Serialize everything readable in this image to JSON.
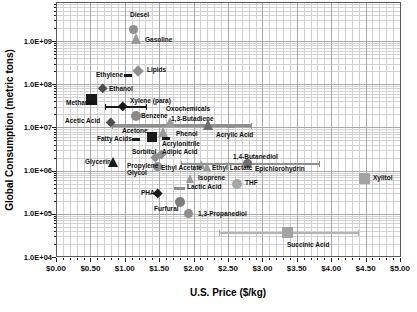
{
  "figure": {
    "background": "#ffffff",
    "frame_color": "#595959",
    "grid_minor_color": "#d2d2d2",
    "grid_major_color": "#a8a8a8",
    "tick_color": "#1a1a1a"
  },
  "chart_data": {
    "type": "scatter",
    "title": "",
    "xlabel": "U.S. Price ($/kg)",
    "ylabel": "Global Consumption (metric tons)",
    "x_axis": {
      "min": 0,
      "max": 5,
      "major_step": 0.5,
      "minor_step": 0.1,
      "tick_labels": [
        "$0.00",
        "$0.50",
        "$1.00",
        "$1.50",
        "$2.00",
        "$2.50",
        "$3.00",
        "$3.50",
        "$4.00",
        "$4.50",
        "$5.00"
      ]
    },
    "y_axis": {
      "scale": "log",
      "min": 10000.0,
      "max": 8000000000.0,
      "tick_values": [
        10000.0,
        100000.0,
        1000000.0,
        10000000.0,
        100000000.0,
        1000000000.0
      ],
      "tick_labels": [
        "1.0E+04",
        "1.0E+05",
        "1.0E+06",
        "1.0E+07",
        "1.0E+08",
        "1.0E+09"
      ]
    },
    "grid": "both-major-minor",
    "legend": "none",
    "points": [
      {
        "name": "Diesel",
        "price": 1.12,
        "tons": 1800000000.0,
        "marker": "circle",
        "color": "#8f8f8f",
        "size": 9,
        "label_px": [
          130,
          11
        ]
      },
      {
        "name": "Gasoline",
        "price": 1.17,
        "tons": 1100000000.0,
        "marker": "triangle",
        "color": "#9a9a9a",
        "size": 11,
        "label_px": [
          145,
          36
        ]
      },
      {
        "name": "Lipids",
        "price": 1.19,
        "tons": 200000000.0,
        "marker": "diamond",
        "color": "#8f8f8f",
        "size": 11,
        "label_px": [
          147,
          66
        ]
      },
      {
        "name": "Ethylene",
        "price": 1.05,
        "tons": 160000000.0,
        "marker": "dash",
        "color": "#1a1a1a",
        "size": 8,
        "label_px": [
          96,
          71
        ]
      },
      {
        "name": "Ethanol",
        "price": 0.68,
        "tons": 80000000.0,
        "marker": "diamond",
        "color": "#4d4d4d",
        "size": 10,
        "label_px": [
          109,
          85
        ]
      },
      {
        "name": "Methanol",
        "price": 0.51,
        "tons": 45000000.0,
        "marker": "square",
        "color": "#1a1a1a",
        "size": 11,
        "label_px": [
          66,
          99
        ]
      },
      {
        "name": "Xylene (para)",
        "price": 0.97,
        "tons": 30000000.0,
        "marker": "diamond",
        "color": "#1a1a1a",
        "size": 10,
        "err": [
          0.71,
          1.32
        ],
        "err_color": "#1a1a1a",
        "err_w": 1.5,
        "label_px": [
          130,
          97
        ]
      },
      {
        "name": "Benzene",
        "price": 1.16,
        "tons": 18000000.0,
        "marker": "circle",
        "color": "#8a8a8a",
        "size": 10,
        "label_px": [
          141,
          112
        ]
      },
      {
        "name": "Acetic Acid",
        "price": 0.8,
        "tons": 13000000.0,
        "marker": "diamond",
        "color": "#4d4d4d",
        "size": 10,
        "label_px": [
          65,
          117
        ]
      },
      {
        "name": "Oxochemicals",
        "price": 1.66,
        "tons": 12500000.0,
        "marker": "triangle",
        "color": "#9a9a9a",
        "size": 10,
        "label_px": [
          166,
          105
        ]
      },
      {
        "name": "1,3-Butadiene",
        "price": 2.21,
        "tons": 11000000.0,
        "marker": "triangle",
        "color": "#6e6e6e",
        "size": 11,
        "err": [
          0.81,
          2.85
        ],
        "err_color": "#8f8f8f",
        "err_w": 3,
        "label_px": [
          171,
          115
        ]
      },
      {
        "name": "Acrylic Acid",
        "price": 2.55,
        "tons": 10500000.0,
        "marker": "dash",
        "color": "#8f8f8f",
        "size": 8,
        "label_px": [
          216,
          131
        ]
      },
      {
        "name": "Acetone",
        "price": 1.4,
        "tons": 6000000.0,
        "marker": "square",
        "color": "#1a1a1a",
        "size": 10,
        "label_px": [
          122,
          127
        ]
      },
      {
        "name": "Fatty Acids",
        "price": 1.16,
        "tons": 5300000.0,
        "marker": "dash",
        "color": "#1a1a1a",
        "size": 8,
        "label_px": [
          97,
          135
        ]
      },
      {
        "name": "Phenol",
        "price": 1.56,
        "tons": 7500000.0,
        "marker": "triangle",
        "color": "#9a9a9a",
        "size": 10,
        "label_px": [
          176,
          130
        ]
      },
      {
        "name": "Acrylonitrile",
        "price": 1.6,
        "tons": 5500000.0,
        "marker": "dash",
        "color": "#1a1a1a",
        "size": 8,
        "label_px": [
          162,
          140
        ]
      },
      {
        "name": "Glycerin",
        "price": 0.83,
        "tons": 1500000.0,
        "marker": "triangle",
        "color": "#1a1a1a",
        "size": 10,
        "label_px": [
          85,
          158
        ]
      },
      {
        "name": "Sorbitol",
        "price": 1.45,
        "tons": 2000000.0,
        "marker": "diamond",
        "color": "#8f8f8f",
        "size": 9,
        "label_px": [
          132,
          148
        ]
      },
      {
        "name": "Adipic Acid",
        "price": 1.53,
        "tons": 2400000.0,
        "marker": "diamond",
        "color": "#8f8f8f",
        "size": 9,
        "label_px": [
          162,
          148
        ]
      },
      {
        "name": "Propylene Glycol",
        "label": "Propylene\nGlycol",
        "price": 1.47,
        "tons": 1250000.0,
        "marker": "circle",
        "color": "#8f8f8f",
        "size": 9,
        "label_px": [
          127,
          162
        ]
      },
      {
        "name": "Ethyl Acetate",
        "price": 2.11,
        "tons": 1300000.0,
        "marker": "triangle",
        "color": "#9a9a9a",
        "size": 9,
        "label_px": [
          161,
          164
        ]
      },
      {
        "name": "Ethyl Lactate",
        "price": 2.2,
        "tons": 1200000.0,
        "marker": "triangle",
        "color": "#9a9a9a",
        "size": 9,
        "label_px": [
          212,
          164
        ]
      },
      {
        "name": "1,4-Butanediol",
        "price": 2.79,
        "tons": 1450000.0,
        "marker": "circle",
        "color": "#6e6e6e",
        "size": 9,
        "err": [
          1.82,
          3.84
        ],
        "err_color": "#8f8f8f",
        "err_w": 2,
        "label_px": [
          233,
          153
        ]
      },
      {
        "name": "Epichlorohydrin",
        "price": 2.95,
        "tons": 1000000.0,
        "marker": "none",
        "color": "#8f8f8f",
        "size": 0,
        "label_px": [
          255,
          165
        ]
      },
      {
        "name": "Isoprene",
        "price": 1.95,
        "tons": 630000.0,
        "marker": "triangle",
        "color": "#9a9a9a",
        "size": 9,
        "label_px": [
          198,
          174
        ]
      },
      {
        "name": "Lactic Acid",
        "price": 1.8,
        "tons": 380000.0,
        "marker": "dash",
        "color": "#8f8f8f",
        "size": 11,
        "label_px": [
          187,
          183
        ]
      },
      {
        "name": "THF",
        "price": 2.63,
        "tons": 490000.0,
        "marker": "circle",
        "color": "#a6a6a6",
        "size": 10,
        "label_px": [
          245,
          179
        ]
      },
      {
        "name": "PHA",
        "price": 1.48,
        "tons": 290000.0,
        "marker": "diamond",
        "color": "#1a1a1a",
        "size": 10,
        "label_px": [
          141,
          189
        ]
      },
      {
        "name": "Furfural",
        "price": 1.8,
        "tons": 190000.0,
        "marker": "circle",
        "color": "#7d7d7d",
        "size": 10,
        "label_px": [
          154,
          205
        ]
      },
      {
        "name": "1,3-Propanediol",
        "price": 1.93,
        "tons": 100000.0,
        "marker": "circle",
        "color": "#8f8f8f",
        "size": 9,
        "label_px": [
          198,
          210
        ]
      },
      {
        "name": "Xylitol",
        "price": 4.48,
        "tons": 660000.0,
        "marker": "square",
        "color": "#a3a3a3",
        "size": 11,
        "label_px": [
          373,
          174
        ]
      },
      {
        "name": "Succinic Acid",
        "price": 3.37,
        "tons": 36000.0,
        "marker": "square",
        "color": "#a3a3a3",
        "size": 11,
        "err": [
          2.37,
          4.4
        ],
        "err_color": "#b3b3b3",
        "err_w": 2,
        "label_px": [
          287,
          241
        ]
      }
    ]
  }
}
